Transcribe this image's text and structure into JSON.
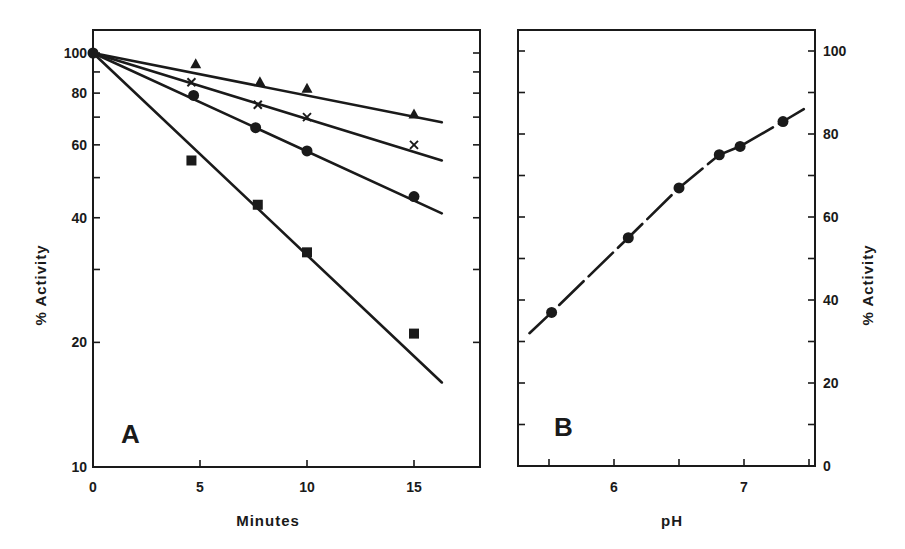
{
  "chart_data": [
    {
      "panel": "A",
      "type": "line",
      "xlabel": "Minutes",
      "ylabel": "% Activity",
      "yscale": "log",
      "xlim": [
        0,
        18
      ],
      "ylim": [
        10,
        110
      ],
      "xticks": [
        0,
        5,
        10,
        15
      ],
      "yticks_labeled": [
        10,
        20,
        40,
        60,
        80,
        100
      ],
      "yticks_minor": [
        30,
        50,
        70,
        90
      ],
      "grid": false,
      "legend": null,
      "series": [
        {
          "name": "triangle",
          "marker": "triangle",
          "points": [
            [
              0,
              100
            ],
            [
              4.8,
              94
            ],
            [
              7.8,
              85
            ],
            [
              10,
              82
            ],
            [
              15,
              71
            ]
          ],
          "fit": [
            [
              0,
              100
            ],
            [
              16.3,
              68
            ]
          ]
        },
        {
          "name": "cross",
          "marker": "x",
          "points": [
            [
              0,
              100
            ],
            [
              4.6,
              85
            ],
            [
              7.7,
              75
            ],
            [
              10,
              70
            ],
            [
              15,
              60
            ]
          ],
          "fit": [
            [
              0,
              100
            ],
            [
              16.3,
              55
            ]
          ]
        },
        {
          "name": "circle",
          "marker": "circle",
          "points": [
            [
              0,
              100
            ],
            [
              4.7,
              79
            ],
            [
              7.6,
              66
            ],
            [
              10,
              58
            ],
            [
              15,
              45
            ]
          ],
          "fit": [
            [
              0,
              100
            ],
            [
              16.3,
              41
            ]
          ]
        },
        {
          "name": "square",
          "marker": "square",
          "points": [
            [
              0,
              100
            ],
            [
              4.6,
              55
            ],
            [
              7.7,
              43
            ],
            [
              10,
              33
            ],
            [
              15,
              21
            ]
          ],
          "fit": [
            [
              0,
              100
            ],
            [
              16.3,
              16
            ]
          ]
        }
      ]
    },
    {
      "panel": "B",
      "type": "line",
      "xlabel": "pH",
      "ylabel": "% Activity",
      "yscale": "linear",
      "ylabel_side": "right",
      "xlim": [
        5.2,
        7.55
      ],
      "ylim": [
        0,
        105
      ],
      "xticks_labeled": [
        6,
        7
      ],
      "xticks_minor": [
        5.5,
        6.5,
        7.5
      ],
      "yticks_labeled": [
        0,
        20,
        40,
        60,
        80,
        100
      ],
      "yticks_minor": [
        10,
        30,
        50,
        70,
        90
      ],
      "grid": false,
      "legend": null,
      "series": [
        {
          "name": "circle",
          "marker": "circle",
          "points": [
            [
              5.52,
              37
            ],
            [
              6.11,
              55
            ],
            [
              6.5,
              67
            ],
            [
              6.81,
              75
            ],
            [
              6.97,
              77
            ],
            [
              7.3,
              83
            ]
          ],
          "fit": [
            [
              5.35,
              32
            ],
            [
              5.52,
              37
            ],
            [
              6.11,
              55
            ],
            [
              6.5,
              67
            ],
            [
              6.81,
              75
            ],
            [
              6.97,
              77
            ],
            [
              7.3,
              83
            ],
            [
              7.46,
              86
            ]
          ]
        }
      ]
    }
  ],
  "labels": {
    "panel_a_letter": "A",
    "panel_b_letter": "B",
    "panel_a_xlabel": "Minutes",
    "panel_b_xlabel": "pH",
    "panel_a_ylabel": "% Activity",
    "panel_b_ylabel": "% Activity"
  }
}
